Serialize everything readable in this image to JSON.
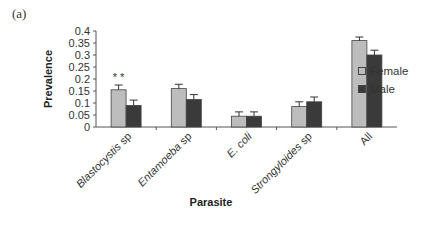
{
  "panel_label": "(a)",
  "chart_data": {
    "type": "bar",
    "title": "",
    "xlabel": "Parasite",
    "ylabel": "Prevalence",
    "ylim": [
      0,
      0.4
    ],
    "yticks": [
      "0",
      "0.05",
      "0.1",
      "0.15",
      "0.2",
      "0.25",
      "0.3",
      "0.35",
      "0.4"
    ],
    "grid": false,
    "legend_position": "right",
    "categories": [
      "Blastocystis sp",
      "Entamoeba sp",
      "E. coli",
      "Strongyloides sp",
      "All"
    ],
    "series": [
      {
        "name": "Female",
        "color": "#bdbdbd",
        "values": [
          0.155,
          0.16,
          0.045,
          0.085,
          0.36
        ],
        "errors": [
          0.02,
          0.018,
          0.018,
          0.02,
          0.015
        ]
      },
      {
        "name": "Male",
        "color": "#3a3a3a",
        "values": [
          0.09,
          0.115,
          0.045,
          0.105,
          0.3
        ],
        "errors": [
          0.022,
          0.02,
          0.018,
          0.02,
          0.02
        ]
      }
    ],
    "annotations": [
      {
        "category": "Blastocystis sp",
        "text": "* *"
      }
    ]
  },
  "legend": {
    "items": [
      {
        "label": "Female",
        "color": "#bdbdbd"
      },
      {
        "label": "Male",
        "color": "#3a3a3a"
      }
    ]
  }
}
